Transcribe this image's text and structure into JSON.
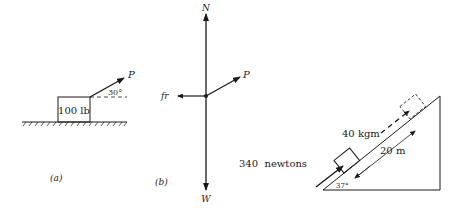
{
  "figure_a": {
    "block_label": "100 lb",
    "force_label": "P",
    "angle_label": "30°",
    "caption": "(a)"
  },
  "figure_b": {
    "normal_label": "N",
    "weight_label": "W",
    "friction_label": "fr",
    "force_label": "P",
    "caption": "(b)"
  },
  "figure_c": {
    "mass_label": "40 kgm",
    "force_label": "340  newtons",
    "distance_label": "20 m",
    "angle_label": "37°"
  },
  "colors": {
    "ink": "#1a1a1a",
    "background": "#ffffff"
  }
}
